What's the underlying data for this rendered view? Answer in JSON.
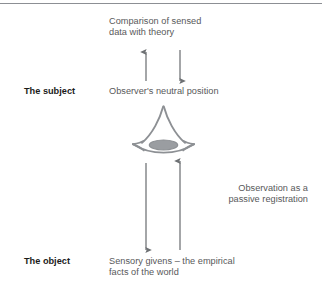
{
  "figure": {
    "type": "concept-diagram",
    "title_caption": "Comparison of sensed\ndata with theory",
    "side_caption": "Observation as a\npassive registration",
    "rows": [
      {
        "label": "The subject",
        "text": "Observer's neutral position"
      },
      {
        "label": "The object",
        "text": "Sensory givens – the empirical\nfacts of the world"
      }
    ],
    "center_icon": "eye-icon",
    "arrows": [
      {
        "name": "arrow-up-to-theory",
        "direction": "up"
      },
      {
        "name": "arrow-down-from-theory",
        "direction": "down"
      },
      {
        "name": "arrow-down-to-object",
        "direction": "down"
      },
      {
        "name": "arrow-up-from-object",
        "direction": "up"
      }
    ],
    "colors": {
      "text_gray": "#58585a",
      "label_black": "#1b1b1b",
      "line_gray": "#8c8f94",
      "arrow_gray": "#6e7174",
      "eye_stroke": "#8d9094",
      "pupil_fill": "#9a9da1",
      "background": "#ffffff"
    }
  }
}
